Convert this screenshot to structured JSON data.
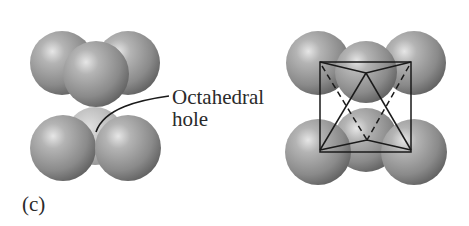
{
  "figure": {
    "panel_label": "(c)",
    "annotation": {
      "line1": "Octahedral",
      "line2": "hole"
    }
  },
  "colors": {
    "background": "#ffffff",
    "sphere_dark": "#6e6e6e",
    "sphere_mid": "#9a9a9a",
    "sphere_light": "#d8d8d8",
    "hole_sphere": "#b8b8b8",
    "line": "#1a1a1a",
    "text": "#2a2a2a"
  },
  "left_model": {
    "description": "Two layers of three spheres; lower layer reveals octahedral hole",
    "spheres": [
      {
        "name": "top-back-left",
        "cx": 62,
        "cy": 63,
        "r": 32
      },
      {
        "name": "top-back-right",
        "cx": 128,
        "cy": 63,
        "r": 32
      },
      {
        "name": "top-front",
        "cx": 96,
        "cy": 74,
        "r": 33
      },
      {
        "name": "bottom-back",
        "cx": 95,
        "cy": 136,
        "r": 29
      },
      {
        "name": "bottom-left",
        "cx": 63,
        "cy": 148,
        "r": 33
      },
      {
        "name": "bottom-right",
        "cx": 128,
        "cy": 148,
        "r": 33
      }
    ]
  },
  "right_model": {
    "description": "Same arrangement with octahedron outlined",
    "spheres": [
      {
        "name": "top-left",
        "cx": 318,
        "cy": 63,
        "r": 32
      },
      {
        "name": "top-right",
        "cx": 414,
        "cy": 63,
        "r": 32
      },
      {
        "name": "top-middle",
        "cx": 366,
        "cy": 72,
        "r": 31
      },
      {
        "name": "bottom-middle",
        "cx": 366,
        "cy": 140,
        "r": 32
      },
      {
        "name": "bottom-left",
        "cx": 318,
        "cy": 152,
        "r": 33
      },
      {
        "name": "bottom-right",
        "cx": 414,
        "cy": 152,
        "r": 33
      }
    ]
  }
}
